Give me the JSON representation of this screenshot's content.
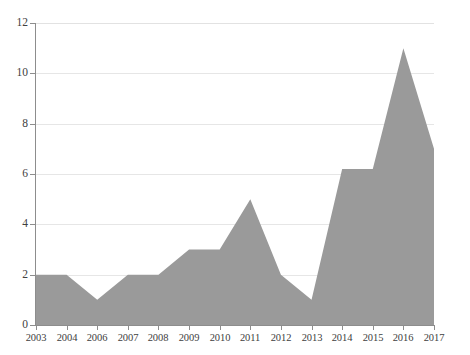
{
  "chart_data": {
    "type": "area",
    "title": "",
    "subtitle": "",
    "xlabel": "",
    "ylabel": "",
    "categories": [
      "2003",
      "2004",
      "2006",
      "2007",
      "2008",
      "2009",
      "2010",
      "2011",
      "2012",
      "2013",
      "2014",
      "2015",
      "2016",
      "2017"
    ],
    "values": [
      2,
      2,
      1,
      2,
      2,
      3,
      3,
      5,
      2,
      1,
      6.2,
      6.2,
      11,
      7
    ],
    "series": [
      {
        "name": "",
        "values": [
          2,
          2,
          1,
          2,
          2,
          3,
          3,
          5,
          2,
          1,
          6.2,
          6.2,
          11,
          7
        ]
      }
    ],
    "ylim": [
      0,
      12
    ],
    "yticks": [
      0,
      2,
      4,
      6,
      8,
      10,
      12
    ],
    "ytick_labels": [
      "0",
      "2",
      "4",
      "6",
      "8",
      "10",
      "12"
    ],
    "xtick_labels": [
      "2003",
      "2004",
      "2006",
      "2007",
      "2008",
      "2009",
      "2010",
      "2011",
      "2012",
      "2013",
      "2014",
      "2015",
      "2016",
      "2017"
    ],
    "grid": true,
    "grid_axis": "y",
    "legend": false,
    "legend_position": "none",
    "annotations": [],
    "colors": {
      "area_fill": "#9a9a9a",
      "gridline": "#e6e6e6",
      "axis_line": "#8d8d8d",
      "tick_label": "#404040",
      "background": "#ffffff"
    }
  }
}
